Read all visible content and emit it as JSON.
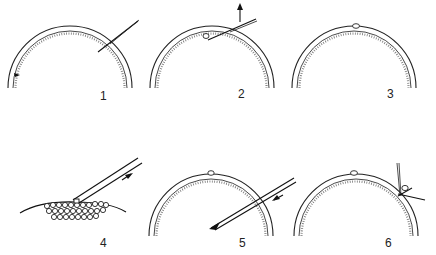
{
  "figure": {
    "type": "multi-panel line illustration",
    "panel_count": 6,
    "layout": "2 rows x 3 columns",
    "background": "#ffffff",
    "ink": "#222222"
  },
  "panels": [
    {
      "label": "1",
      "depiction": "dome-shaped layered membrane with a needle/pipette inserted diagonally from upper right; small dark mark on left inner wall"
    },
    {
      "label": "2",
      "depiction": "dome with pipette inserted from upper right, small cell at pipette tip, upward arrow indicating withdrawal"
    },
    {
      "label": "3",
      "depiction": "dome with small cell lodged at the top between the layers"
    },
    {
      "label": "4",
      "depiction": "cluster of round cells on a curved surface, pipette aspirating a cell, arrow pointing up along pipette"
    },
    {
      "label": "5",
      "depiction": "dome with cell at top, beveled pipette inserted from right into the interior, arrow pointing down along pipette"
    },
    {
      "label": "6",
      "depiction": "dome with cell at top, second cell at right edge with crossing needles (scissors-like) cutting/sealing"
    }
  ]
}
